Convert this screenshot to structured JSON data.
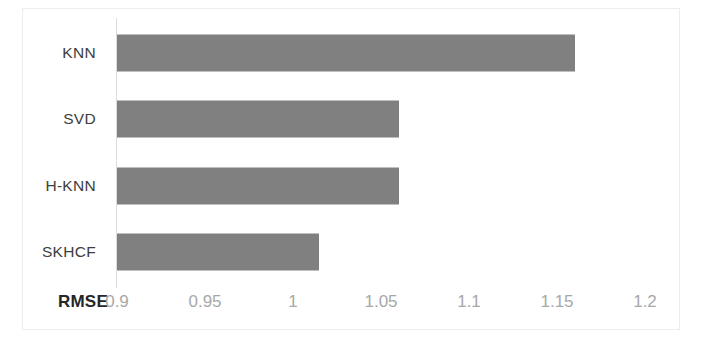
{
  "chart_data": {
    "type": "bar",
    "orientation": "horizontal",
    "title": "",
    "xlabel": "RMSE",
    "ylabel": "",
    "categories": [
      "KNN",
      "SVD",
      "H-KNN",
      "SKHCF"
    ],
    "values": [
      1.16,
      1.06,
      1.06,
      1.015
    ],
    "series": [
      {
        "name": "RMSE",
        "values": [
          1.16,
          1.06,
          1.06,
          1.015
        ]
      }
    ],
    "xlim": [
      0.9,
      1.2
    ],
    "xticks": [
      "0.9",
      "0.95",
      "1",
      "1.05",
      "1.1",
      "1.15",
      "1.2"
    ],
    "xtick_values": [
      0.9,
      0.95,
      1,
      1.05,
      1.1,
      1.15,
      1.2
    ],
    "grid": false,
    "legend": false,
    "legend_position": "none",
    "bar_color": "#808080",
    "tick_label_color": "#a8a8a8",
    "category_label_color": "#3d3d3d",
    "axis_title_color": "#262626",
    "annotations": []
  }
}
